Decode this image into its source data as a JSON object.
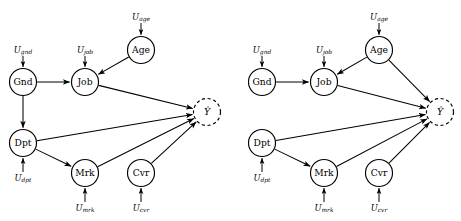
{
  "figure": {
    "background_color": "#ffffff",
    "stroke_color": "#000000",
    "panel_count": 2
  },
  "labels": {
    "gnd": "Gnd",
    "job": "Job",
    "age": "Age",
    "dpt": "Dpt",
    "mrk": "Mrk",
    "cvr": "Cvr",
    "yhat": "Ŷ",
    "u_gnd_base": "U",
    "u_gnd_sub": "gnd",
    "u_job_base": "U",
    "u_job_sub": "job",
    "u_age_base": "U",
    "u_age_sub": "age",
    "u_dpt_base": "U",
    "u_dpt_sub": "dpt",
    "u_mrk_base": "U",
    "u_mrk_sub": "mrk",
    "u_cvr_base": "U",
    "u_cvr_sub": "cvr"
  },
  "panels": [
    {
      "id": "left-panel",
      "name": "left-causal-graph",
      "nodes": [
        {
          "id": "gnd",
          "label": "Gnd",
          "cx": 23,
          "cy": 82,
          "r": 13.5,
          "dashed": false
        },
        {
          "id": "job",
          "label": "Job",
          "cx": 85,
          "cy": 82,
          "r": 13.5,
          "dashed": false
        },
        {
          "id": "age",
          "label": "Age",
          "cx": 141,
          "cy": 50,
          "r": 13.5,
          "dashed": false
        },
        {
          "id": "dpt",
          "label": "Dpt",
          "cx": 23,
          "cy": 143,
          "r": 13.5,
          "dashed": false
        },
        {
          "id": "mrk",
          "label": "Mrk",
          "cx": 85,
          "cy": 173,
          "r": 13.5,
          "dashed": false
        },
        {
          "id": "cvr",
          "label": "Cvr",
          "cx": 141,
          "cy": 173,
          "r": 13.5,
          "dashed": false
        },
        {
          "id": "yhat",
          "label": "Ŷ",
          "cx": 207,
          "cy": 112,
          "r": 13.5,
          "dashed": true
        }
      ],
      "noise_terms": [
        {
          "id": "u_gnd",
          "base": "U",
          "sub": "gnd",
          "x": 23,
          "y": 50,
          "target": "gnd",
          "direction": "down"
        },
        {
          "id": "u_job",
          "base": "U",
          "sub": "job",
          "x": 85,
          "y": 50,
          "target": "job",
          "direction": "down"
        },
        {
          "id": "u_age",
          "base": "U",
          "sub": "age",
          "x": 141,
          "y": 17,
          "target": "age",
          "direction": "down"
        },
        {
          "id": "u_dpt",
          "base": "U",
          "sub": "dpt",
          "x": 23,
          "y": 178,
          "target": "dpt",
          "direction": "up"
        },
        {
          "id": "u_mrk",
          "base": "U",
          "sub": "mrk",
          "x": 85,
          "y": 208,
          "target": "mrk",
          "direction": "up"
        },
        {
          "id": "u_cvr",
          "base": "U",
          "sub": "cvr",
          "x": 141,
          "y": 208,
          "target": "cvr",
          "direction": "up"
        }
      ],
      "edges": [
        {
          "from": "gnd",
          "to": "job"
        },
        {
          "from": "gnd",
          "to": "dpt"
        },
        {
          "from": "age",
          "to": "job"
        },
        {
          "from": "dpt",
          "to": "mrk"
        },
        {
          "from": "job",
          "to": "yhat"
        },
        {
          "from": "dpt",
          "to": "yhat"
        },
        {
          "from": "mrk",
          "to": "yhat"
        },
        {
          "from": "cvr",
          "to": "yhat"
        }
      ]
    },
    {
      "id": "right-panel",
      "name": "right-causal-graph",
      "nodes": [
        {
          "id": "gnd",
          "label": "Gnd",
          "cx": 262,
          "cy": 82,
          "r": 13.5,
          "dashed": false
        },
        {
          "id": "job",
          "label": "Job",
          "cx": 324,
          "cy": 82,
          "r": 13.5,
          "dashed": false
        },
        {
          "id": "age",
          "label": "Age",
          "cx": 379,
          "cy": 50,
          "r": 13.5,
          "dashed": false
        },
        {
          "id": "dpt",
          "label": "Dpt",
          "cx": 262,
          "cy": 143,
          "r": 13.5,
          "dashed": false
        },
        {
          "id": "mrk",
          "label": "Mrk",
          "cx": 324,
          "cy": 173,
          "r": 13.5,
          "dashed": false
        },
        {
          "id": "cvr",
          "label": "Cvr",
          "cx": 379,
          "cy": 173,
          "r": 13.5,
          "dashed": false
        },
        {
          "id": "yhat",
          "label": "Ŷ",
          "cx": 440,
          "cy": 112,
          "r": 13.5,
          "dashed": true
        }
      ],
      "noise_terms": [
        {
          "id": "u_gnd",
          "base": "U",
          "sub": "gnd",
          "x": 262,
          "y": 50,
          "target": "gnd",
          "direction": "down"
        },
        {
          "id": "u_job",
          "base": "U",
          "sub": "job",
          "x": 324,
          "y": 50,
          "target": "job",
          "direction": "down"
        },
        {
          "id": "u_age",
          "base": "U",
          "sub": "age",
          "x": 379,
          "y": 17,
          "target": "age",
          "direction": "down"
        },
        {
          "id": "u_dpt",
          "base": "U",
          "sub": "dpt",
          "x": 262,
          "y": 178,
          "target": "dpt",
          "direction": "up"
        },
        {
          "id": "u_mrk",
          "base": "U",
          "sub": "mrk",
          "x": 324,
          "y": 208,
          "target": "mrk",
          "direction": "up"
        },
        {
          "id": "u_cvr",
          "base": "U",
          "sub": "cvr",
          "x": 379,
          "y": 208,
          "target": "cvr",
          "direction": "up"
        }
      ],
      "edges": [
        {
          "from": "gnd",
          "to": "job"
        },
        {
          "from": "age",
          "to": "job"
        },
        {
          "from": "dpt",
          "to": "mrk"
        },
        {
          "from": "age",
          "to": "yhat"
        },
        {
          "from": "job",
          "to": "yhat"
        },
        {
          "from": "dpt",
          "to": "yhat"
        },
        {
          "from": "mrk",
          "to": "yhat"
        },
        {
          "from": "cvr",
          "to": "yhat"
        }
      ]
    }
  ]
}
